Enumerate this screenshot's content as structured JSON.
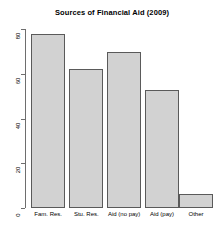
{
  "chart_data": {
    "type": "bar",
    "title": "Sources of Financial Aid (2009)",
    "categories": [
      "Fam. Res.",
      "Stu. Res.",
      "Aid (no pay)",
      "Aid (pay)",
      "Other"
    ],
    "values": [
      78,
      62,
      70,
      53,
      6
    ],
    "xlabel": "",
    "ylabel": "",
    "ylim": [
      0,
      80
    ],
    "yticks": [
      0,
      20,
      40,
      60,
      80
    ],
    "ytick_labels": [
      "0",
      "20",
      "40",
      "60",
      "80"
    ],
    "grid": false,
    "legend": false,
    "bar_fill_color": "#d2d2d2",
    "bar_border_color": "#5a5a5a",
    "axis_color": "#6e6e6e",
    "background_color": "#ffffff",
    "text_color": "#000000"
  }
}
